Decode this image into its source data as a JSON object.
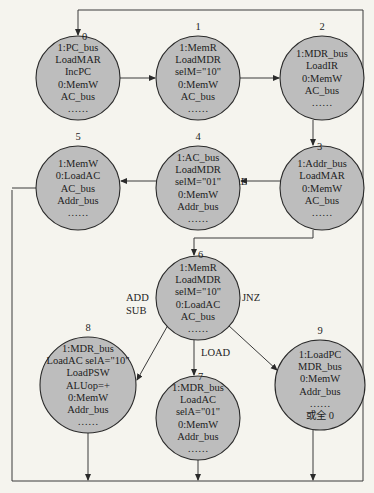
{
  "diagram": {
    "type": "state-machine",
    "states": [
      {
        "id": "0",
        "label": "0",
        "cx": 78,
        "cy": 78,
        "r": 42,
        "lines": [
          "1:PC_bus",
          "LoadMAR",
          "IncPC",
          "0:MemW",
          "AC_bus",
          "……"
        ]
      },
      {
        "id": "1",
        "label": "1",
        "cx": 198,
        "cy": 78,
        "r": 42,
        "lines": [
          "1:MemR",
          "LoadMDR",
          "selM=\"10\"",
          "0:MemW",
          "AC_bus",
          "……"
        ]
      },
      {
        "id": "2",
        "label": "2",
        "cx": 322,
        "cy": 78,
        "r": 42,
        "lines": [
          "1:MDR_bus",
          "LoadIR",
          "0:MemW",
          "AC_bus",
          "……"
        ]
      },
      {
        "id": "3",
        "label": "3",
        "cx": 322,
        "cy": 188,
        "r": 42,
        "lines": [
          "1:Addr_bus",
          "LoadMAR",
          "0:MemW",
          "AC_bus",
          "……"
        ]
      },
      {
        "id": "4",
        "label": "4",
        "cx": 198,
        "cy": 188,
        "r": 42,
        "lines": [
          "1:AC_bus",
          "LoadMDR",
          "selM=\"01\"",
          "0:MemW",
          "Addr_bus",
          "……"
        ]
      },
      {
        "id": "5",
        "label": "5",
        "cx": 78,
        "cy": 188,
        "r": 42,
        "lines": [
          "1:MemW",
          "0:LoadAC",
          "AC_bus",
          "Addr_bus",
          "……"
        ]
      },
      {
        "id": "6",
        "label": "6",
        "cx": 198,
        "cy": 298,
        "r": 42,
        "lines": [
          "1:MemR",
          "LoadMDR",
          "selM=\"10\"",
          "0:LoadAC",
          "AC_bus",
          "……"
        ]
      },
      {
        "id": "7",
        "label": "7",
        "cx": 198,
        "cy": 418,
        "r": 42,
        "lines": [
          "1:MDR_bus",
          "LoadAC",
          "selA=\"01\"",
          "0:MemW",
          "Addr_bus",
          "……"
        ]
      },
      {
        "id": "8",
        "label": "8",
        "cx": 88,
        "cy": 385,
        "r": 48,
        "lines": [
          "1:MDR_bus",
          "LoadAC selA=\"10\"",
          "LoadPSW",
          "ALUop=+",
          "0:MemW",
          "Addr_bus",
          "……"
        ]
      },
      {
        "id": "9",
        "label": "9",
        "cx": 320,
        "cy": 385,
        "r": 45,
        "lines": [
          "1:LoadPC",
          "MDR_bus",
          "0:MemW",
          "Addr_bus",
          "……",
          "或全 0"
        ]
      }
    ],
    "transitions": [
      {
        "from": "0",
        "to": "1",
        "label": ""
      },
      {
        "from": "1",
        "to": "2",
        "label": ""
      },
      {
        "from": "2",
        "to": "3",
        "label": ""
      },
      {
        "from": "3",
        "to": "4",
        "label": "STORE"
      },
      {
        "from": "4",
        "to": "5",
        "label": ""
      },
      {
        "from": "3",
        "to": "6",
        "label": ""
      },
      {
        "from": "6",
        "to": "8",
        "label": "ADD SUB"
      },
      {
        "from": "6",
        "to": "7",
        "label": "LOAD"
      },
      {
        "from": "6",
        "to": "9",
        "label": "JNZ"
      },
      {
        "from": "5",
        "to": "0",
        "label": ""
      },
      {
        "from": "8",
        "to": "0",
        "label": ""
      },
      {
        "from": "7",
        "to": "0",
        "label": ""
      },
      {
        "from": "9",
        "to": "0",
        "label": ""
      }
    ],
    "edge_labels": {
      "store": "STORE",
      "add": "ADD",
      "sub": "SUB",
      "load": "LOAD",
      "jnz": "JNZ"
    }
  }
}
